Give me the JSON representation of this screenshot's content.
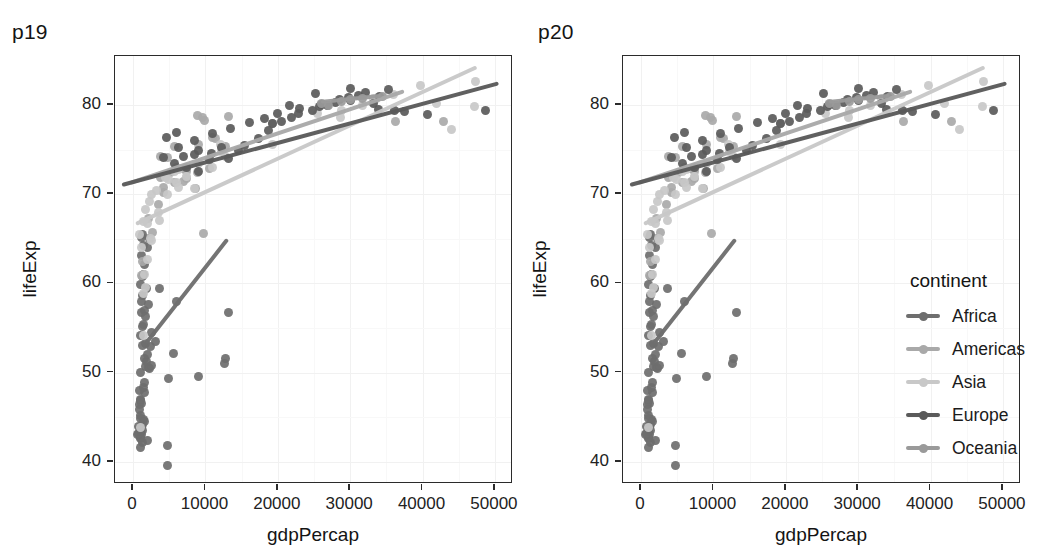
{
  "figure": {
    "panels": [
      {
        "id": "p19",
        "title": "p19",
        "has_legend": false
      },
      {
        "id": "p20",
        "title": "p20",
        "has_legend": true
      }
    ],
    "legend": {
      "title": "continent",
      "entries": [
        {
          "label": "Africa",
          "color": "#6e6e6e"
        },
        {
          "label": "Americas",
          "color": "#a9a9a9"
        },
        {
          "label": "Asia",
          "color": "#c8c8c8"
        },
        {
          "label": "Europe",
          "color": "#5a5a5a"
        },
        {
          "label": "Oceania",
          "color": "#9a9a9a"
        }
      ]
    }
  },
  "chart_data": {
    "type": "scatter",
    "title": "p19",
    "xlabel": "gdpPercap",
    "ylabel": "lifeExp",
    "xlim": [
      -2500,
      52500
    ],
    "ylim": [
      37.5,
      85.5
    ],
    "xticks": [
      0,
      10000,
      20000,
      30000,
      40000,
      50000
    ],
    "xticklabels": [
      "0",
      "10000",
      "20000",
      "30000",
      "40000",
      "50000"
    ],
    "yticks": [
      40,
      50,
      60,
      70,
      80
    ],
    "yticklabels": [
      "40",
      "50",
      "60",
      "70",
      "80"
    ],
    "grid": true,
    "legend_position": "right",
    "legend_title": "continent",
    "series": [
      {
        "name": "Africa",
        "color": "#6e6e6e",
        "fit": {
          "x0": 1400,
          "y0": 52.8,
          "x1": 13100,
          "y1": 64.9
        },
        "points": [
          [
            1271,
            43.5
          ],
          [
            1042,
            42.7
          ],
          [
            1217,
            46.5
          ],
          [
            1713,
            50.7
          ],
          [
            1044,
            54.1
          ],
          [
            1206,
            56.7
          ],
          [
            1133,
            58.0
          ],
          [
            1090,
            50.0
          ],
          [
            974,
            46.9
          ],
          [
            823,
            46.4
          ],
          [
            1569,
            47.8
          ],
          [
            1464,
            48.3
          ],
          [
            2082,
            50.6
          ],
          [
            2441,
            52.9
          ],
          [
            1704,
            53.3
          ],
          [
            1488,
            44.7
          ],
          [
            1107,
            43.0
          ],
          [
            961,
            43.4
          ],
          [
            1010,
            42.6
          ],
          [
            1287,
            42.1
          ],
          [
            2013,
            42.4
          ],
          [
            863,
            48.0
          ],
          [
            2602,
            54.5
          ],
          [
            1598,
            51.6
          ],
          [
            1353,
            55.2
          ],
          [
            1598,
            57.0
          ],
          [
            1335,
            58.6
          ],
          [
            1821,
            59.4
          ],
          [
            2086,
            57.6
          ],
          [
            1500,
            61.0
          ],
          [
            1202,
            63.1
          ],
          [
            1297,
            65.5
          ],
          [
            2013,
            64.0
          ],
          [
            5581,
            52.1
          ],
          [
            4959,
            49.3
          ],
          [
            4797,
            41.8
          ],
          [
            12570,
            51.0
          ],
          [
            12780,
            51.6
          ],
          [
            9065,
            49.6
          ],
          [
            13206,
            56.7
          ],
          [
            4785,
            39.6
          ],
          [
            5937,
            58.0
          ],
          [
            3632,
            59.4
          ],
          [
            1044,
            45.2
          ],
          [
            1327,
            44.2
          ],
          [
            978,
            44.8
          ],
          [
            1156,
            43.9
          ],
          [
            706,
            44.0
          ],
          [
            641,
            43.1
          ],
          [
            1569,
            44.5
          ],
          [
            895,
            45.9
          ],
          [
            1021,
            47.0
          ],
          [
            1569,
            48.9
          ],
          [
            2216,
            50.4
          ],
          [
            1829,
            51.2
          ],
          [
            2042,
            52.0
          ],
          [
            1327,
            53.0
          ],
          [
            1453,
            55.4
          ],
          [
            1749,
            56.3
          ],
          [
            1020,
            59.9
          ],
          [
            1271,
            60.8
          ],
          [
            1597,
            62.1
          ],
          [
            1420,
            64.2
          ],
          [
            2280,
            65.0
          ],
          [
            1201,
            65.2
          ],
          [
            3115,
            53.5
          ],
          [
            2602,
            50.8
          ],
          [
            1085,
            41.6
          ],
          [
            1021,
            43.6
          ],
          [
            806,
            43.2
          ]
        ]
      },
      {
        "name": "Americas",
        "color": "#a9a9a9",
        "fit": {
          "x0": -400,
          "y0": 71.2,
          "x1": 37500,
          "y1": 81.5
        },
        "points": [
          [
            12779,
            75.3
          ],
          [
            9666,
            65.6
          ],
          [
            8948,
            72.4
          ],
          [
            9645,
            78.6
          ],
          [
            7320,
            72.9
          ],
          [
            8948,
            78.8
          ],
          [
            6873,
            72.9
          ],
          [
            5728,
            71.3
          ],
          [
            9809,
            78.3
          ],
          [
            4173,
            70.2
          ],
          [
            3548,
            68.9
          ],
          [
            7408,
            72.9
          ],
          [
            7321,
            71.8
          ],
          [
            11416,
            76.2
          ],
          [
            7007,
            71.4
          ],
          [
            4172,
            70.8
          ],
          [
            5186,
            72.4
          ],
          [
            7430,
            72.5
          ],
          [
            3822,
            74.2
          ],
          [
            9065,
            75.6
          ],
          [
            36319,
            78.2
          ],
          [
            42951,
            78.1
          ],
          [
            11003,
            76.4
          ],
          [
            10611,
            72.9
          ],
          [
            13171,
            78.7
          ],
          [
            19328,
            77.9
          ],
          [
            8685,
            70.6
          ],
          [
            3822,
            71.9
          ],
          [
            2749,
            65.7
          ],
          [
            6025,
            73.0
          ],
          [
            2082,
            67.3
          ],
          [
            1201,
            60.9
          ],
          [
            1270,
            62.5
          ],
          [
            4809,
            74.1
          ],
          [
            5728,
            75.3
          ]
        ]
      },
      {
        "name": "Asia",
        "color": "#c8c8c8",
        "fit": {
          "x0": 400,
          "y0": 66.6,
          "x1": 47500,
          "y1": 84.2
        },
        "points": [
          [
            974,
            43.8
          ],
          [
            1391,
            54.1
          ],
          [
            1713,
            59.5
          ],
          [
            2013,
            62.7
          ],
          [
            2602,
            64.8
          ],
          [
            3632,
            67.0
          ],
          [
            4797,
            70.0
          ],
          [
            5937,
            71.3
          ],
          [
            7320,
            72.0
          ],
          [
            9065,
            73.4
          ],
          [
            12780,
            74.2
          ],
          [
            19328,
            75.6
          ],
          [
            28718,
            78.6
          ],
          [
            31656,
            80.0
          ],
          [
            39725,
            82.2
          ],
          [
            47307,
            82.6
          ],
          [
            47143,
            79.8
          ],
          [
            44016,
            77.3
          ],
          [
            41925,
            80.2
          ],
          [
            33693,
            80.7
          ],
          [
            36023,
            81.2
          ],
          [
            12154,
            74.8
          ],
          [
            10957,
            73.0
          ],
          [
            8458,
            70.6
          ],
          [
            6223,
            70.8
          ],
          [
            4959,
            71.7
          ],
          [
            3540,
            68.0
          ],
          [
            2441,
            65.0
          ],
          [
            1569,
            61.0
          ],
          [
            1392,
            58.9
          ],
          [
            2013,
            66.7
          ],
          [
            1202,
            64.0
          ],
          [
            944,
            65.5
          ],
          [
            1391,
            66.9
          ],
          [
            1704,
            68.3
          ],
          [
            2282,
            69.2
          ],
          [
            3189,
            70.4
          ],
          [
            4519,
            71.9
          ],
          [
            6223,
            72.8
          ],
          [
            2602,
            70.0
          ],
          [
            28821,
            79.4
          ],
          [
            33207,
            80.7
          ],
          [
            25523,
            79.0
          ],
          [
            12104,
            75.6
          ],
          [
            5728,
            72.6
          ]
        ]
      },
      {
        "name": "Europe",
        "color": "#5a5a5a",
        "fit": {
          "x0": -1500,
          "y0": 71.0,
          "x1": 50500,
          "y1": 82.4
        },
        "points": [
          [
            4604,
            76.4
          ],
          [
            5937,
            76.9
          ],
          [
            7007,
            74.2
          ],
          [
            8447,
            74.5
          ],
          [
            9065,
            74.9
          ],
          [
            10557,
            73.9
          ],
          [
            10808,
            74.6
          ],
          [
            12155,
            75.2
          ],
          [
            13171,
            74.0
          ],
          [
            14519,
            74.9
          ],
          [
            15389,
            75.5
          ],
          [
            17262,
            76.3
          ],
          [
            18678,
            77.1
          ],
          [
            19328,
            77.9
          ],
          [
            20510,
            78.2
          ],
          [
            21905,
            78.6
          ],
          [
            22833,
            79.1
          ],
          [
            24768,
            79.4
          ],
          [
            25768,
            79.8
          ],
          [
            26923,
            80.0
          ],
          [
            27968,
            80.3
          ],
          [
            28569,
            80.6
          ],
          [
            29796,
            80.9
          ],
          [
            31163,
            81.1
          ],
          [
            32170,
            81.4
          ],
          [
            33207,
            80.2
          ],
          [
            33965,
            79.5
          ],
          [
            35278,
            81.7
          ],
          [
            36126,
            79.4
          ],
          [
            37506,
            79.3
          ],
          [
            40676,
            78.9
          ],
          [
            48723,
            79.4
          ],
          [
            9065,
            72.5
          ],
          [
            7440,
            73.0
          ],
          [
            5728,
            73.4
          ],
          [
            4172,
            74.1
          ],
          [
            6223,
            75.2
          ],
          [
            8458,
            76.0
          ],
          [
            11003,
            76.8
          ],
          [
            13450,
            77.4
          ],
          [
            16027,
            78.0
          ],
          [
            18159,
            78.5
          ],
          [
            20000,
            79.0
          ],
          [
            23000,
            79.6
          ],
          [
            26000,
            80.1
          ],
          [
            30000,
            80.5
          ],
          [
            34000,
            81.0
          ],
          [
            30035,
            81.8
          ],
          [
            25185,
            81.3
          ],
          [
            21654,
            79.9
          ]
        ]
      },
      {
        "name": "Oceania",
        "color": "#9a9a9a",
        "fit": {
          "x0": 26000,
          "y0": 80.3,
          "x1": 34435,
          "y1": 81.0
        },
        "points": [
          [
            26000,
            80.2
          ],
          [
            28800,
            80.4
          ],
          [
            31656,
            80.7
          ],
          [
            34435,
            81.0
          ],
          [
            27000,
            80.0
          ],
          [
            30000,
            80.6
          ]
        ]
      }
    ]
  }
}
